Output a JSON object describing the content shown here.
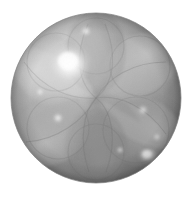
{
  "image": {
    "kind": "raytraced-render",
    "title": "Grayscale rendered translucent sphere",
    "width": 193,
    "height": 198,
    "background_color": "#ffffff",
    "color_mode": "grayscale"
  },
  "sphere": {
    "center_x": 96,
    "center_y": 98,
    "radius": 85,
    "base_color": "#9a9a9a",
    "light_tone": "#d8d8d8",
    "mid_tone": "#a6a6a6",
    "shadow_tone": "#6f6f6f",
    "rim_tone": "#8a8a8a",
    "outline_color": "#7d7d7d"
  },
  "lobes": {
    "count": 6,
    "description": "overlapping translucent petal lobes radiating from sphere center",
    "items": [
      {
        "name": "lobe-top",
        "cx": 96,
        "cy": 52,
        "rx": 30,
        "ry": 40,
        "rotate": 0,
        "tone": "#8e8e8e",
        "opacity": 0.55
      },
      {
        "name": "lobe-upper-right",
        "cx": 139,
        "cy": 72,
        "rx": 32,
        "ry": 40,
        "rotate": 55,
        "tone": "#a8a8a8",
        "opacity": 0.5
      },
      {
        "name": "lobe-lower-right",
        "cx": 142,
        "cy": 132,
        "rx": 33,
        "ry": 40,
        "rotate": 118,
        "tone": "#b2b2b2",
        "opacity": 0.5
      },
      {
        "name": "lobe-bottom",
        "cx": 96,
        "cy": 148,
        "rx": 31,
        "ry": 39,
        "rotate": 178,
        "tone": "#8c8c8c",
        "opacity": 0.5
      },
      {
        "name": "lobe-lower-left",
        "cx": 50,
        "cy": 130,
        "rx": 33,
        "ry": 40,
        "rotate": 238,
        "tone": "#a0a0a0",
        "opacity": 0.5
      },
      {
        "name": "lobe-upper-left",
        "cx": 52,
        "cy": 68,
        "rx": 32,
        "ry": 40,
        "rotate": 300,
        "tone": "#c2c2c2",
        "opacity": 0.55
      }
    ]
  },
  "highlights": [
    {
      "name": "highlight-primary",
      "cx": 70,
      "cy": 64,
      "r": 20,
      "tone": "#f4f4f4",
      "intensity": 1.0
    },
    {
      "name": "highlight-lower-right",
      "cx": 148,
      "cy": 155,
      "r": 9,
      "tone": "#f0f0f0",
      "intensity": 0.92
    },
    {
      "name": "highlight-left",
      "cx": 58,
      "cy": 118,
      "r": 5,
      "tone": "#e4e4e4",
      "intensity": 0.7
    },
    {
      "name": "highlight-top",
      "cx": 86,
      "cy": 31,
      "r": 5,
      "tone": "#e0e0e0",
      "intensity": 0.62
    },
    {
      "name": "highlight-right",
      "cx": 143,
      "cy": 110,
      "r": 5,
      "tone": "#dcdcdc",
      "intensity": 0.6
    },
    {
      "name": "highlight-bottom-right",
      "cx": 157,
      "cy": 137,
      "r": 4,
      "tone": "#d6d6d6",
      "intensity": 0.5
    }
  ],
  "shading": {
    "light_direction": "upper-left",
    "rim_shadow_side": "lower-right",
    "terminator_tone": "#6a6a6a"
  }
}
